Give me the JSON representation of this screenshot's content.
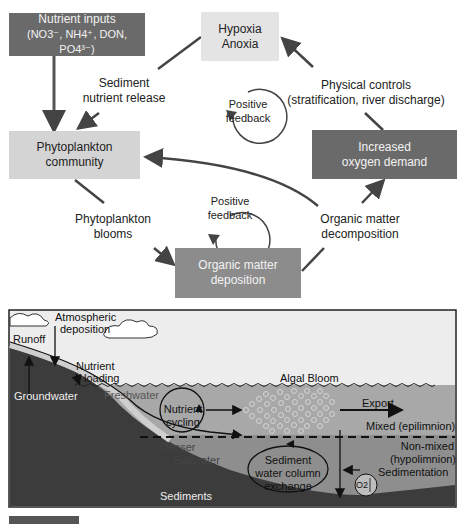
{
  "flowchart": {
    "boxes": {
      "nutrient_inputs": {
        "line1": "Nutrient inputs",
        "line2": "(NO3⁻, NH4⁺, DON, PO4³⁻)"
      },
      "hypoxia": {
        "line1": "Hypoxia",
        "line2": "Anoxia"
      },
      "phytoplankton_community": {
        "line1": "Phytoplankton",
        "line2": "community"
      },
      "increased_oxygen_demand": {
        "line1": "Increased",
        "line2": "oxygen demand"
      },
      "organic_matter_deposition": {
        "line1": "Organic matter",
        "line2": "deposition"
      }
    },
    "labels": {
      "sediment_release": {
        "line1": "Sediment",
        "line2": "nutrient release"
      },
      "physical_controls": {
        "line1": "Physical controls",
        "line2": "(stratification, river discharge)"
      },
      "phytoplankton_blooms": {
        "line1": "Phytoplankton",
        "line2": "blooms"
      },
      "om_decomposition": {
        "line1": "Organic matter",
        "line2": "decomposition"
      }
    },
    "feedback_loops": [
      {
        "line1": "Positive",
        "line2": "feedback"
      },
      {
        "line1": "Positive",
        "line2": "feedback"
      }
    ],
    "colors": {
      "dark_box": "#6a6a6a",
      "mid_box": "#8c8c8c",
      "light_box": "#d4d4d4",
      "arrow": "#444444"
    }
  },
  "estuary_diagram": {
    "labels": {
      "atmospheric": "Atmospheric",
      "deposition": "deposition",
      "runoff": "Runoff",
      "nutrient": "Nutrient",
      "loading": "loading",
      "groundwater": "Groundwater",
      "freshwater": "Freshwater",
      "nutrient_cycling_1": "Nutrient",
      "nutrient_cycling_2": "cycling",
      "algal_bloom": "Algal Bloom",
      "export": "Export",
      "mixed": "Mixed (epilimnion)",
      "non_mixed_1": "Non-mixed",
      "non_mixed_2": "(hypolimnion)",
      "sedimentation": "Sedimentation",
      "denser": "Denser",
      "saltwater": "Saltwater",
      "sediment_exchange_1": "Sediment",
      "sediment_exchange_2": "water column",
      "sediment_exchange_3": "exchange",
      "sediments": "Sediments",
      "oxygen": "O2"
    },
    "colors": {
      "sky": "#ededed",
      "upper_water": "#a8a8a8",
      "lower_water": "#8e8e8e",
      "sediment": "#3c3c3c"
    }
  }
}
